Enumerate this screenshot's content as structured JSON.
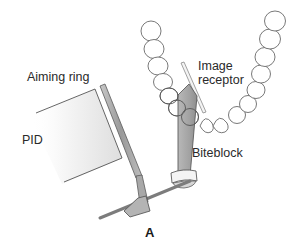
{
  "figure": {
    "panel_label": "A",
    "labels": {
      "aiming_ring": "Aiming ring",
      "pid": "PID",
      "image_receptor_line1": "Image",
      "image_receptor_line2": "receptor",
      "biteblock": "Biteblock"
    },
    "colors": {
      "outline": "#555555",
      "tooth_outline": "#6a6a6a",
      "instrument_gray": "#a9a9a9",
      "instrument_dark": "#7f7f7f",
      "pid_gradient_start": "#ffffff",
      "pid_gradient_end": "#e2e2e2"
    }
  }
}
